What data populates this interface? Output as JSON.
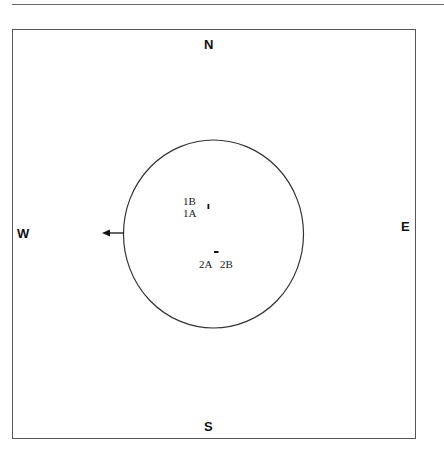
{
  "compass": {
    "north": "N",
    "south": "S",
    "east": "E",
    "west": "W"
  },
  "points": [
    {
      "id": "1B",
      "label": "1B"
    },
    {
      "id": "1A",
      "label": "1A"
    },
    {
      "id": "2A",
      "label": "2A"
    },
    {
      "id": "2B",
      "label": "2B"
    }
  ],
  "arrow": {
    "direction": "west"
  },
  "colors": {
    "line": "#333333",
    "text": "#111111"
  }
}
